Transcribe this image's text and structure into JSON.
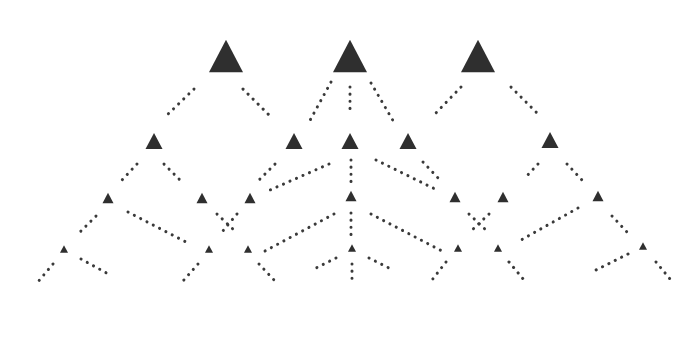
{
  "diagram": {
    "title": "",
    "colors": {
      "node": "#2f2f2f",
      "edge": "#3a3a3a",
      "background": "#ffffff"
    },
    "dot_spacing": 7,
    "nodes": [
      {
        "id": "A",
        "x": 226,
        "y": 56,
        "size": 34
      },
      {
        "id": "B",
        "x": 350,
        "y": 56,
        "size": 34
      },
      {
        "id": "C",
        "x": 478,
        "y": 56,
        "size": 34
      },
      {
        "id": "A1",
        "x": 154,
        "y": 141,
        "size": 17
      },
      {
        "id": "A2",
        "x": 294,
        "y": 141,
        "size": 17
      },
      {
        "id": "B1",
        "x": 350,
        "y": 141,
        "size": 17
      },
      {
        "id": "B2",
        "x": 408,
        "y": 141,
        "size": 17
      },
      {
        "id": "C1",
        "x": 550,
        "y": 140,
        "size": 17
      },
      {
        "id": "L3a",
        "x": 108,
        "y": 198,
        "size": 11
      },
      {
        "id": "L3b",
        "x": 202,
        "y": 198,
        "size": 11
      },
      {
        "id": "L3c",
        "x": 250,
        "y": 198,
        "size": 11
      },
      {
        "id": "L3d",
        "x": 351,
        "y": 196,
        "size": 11
      },
      {
        "id": "L3e",
        "x": 455,
        "y": 197,
        "size": 11
      },
      {
        "id": "L3f",
        "x": 503,
        "y": 197,
        "size": 11
      },
      {
        "id": "L3g",
        "x": 598,
        "y": 196,
        "size": 11
      },
      {
        "id": "L4a",
        "x": 64,
        "y": 249,
        "size": 8
      },
      {
        "id": "L4b",
        "x": 209,
        "y": 249,
        "size": 8
      },
      {
        "id": "L4c",
        "x": 248,
        "y": 249,
        "size": 8
      },
      {
        "id": "L4d",
        "x": 352,
        "y": 248,
        "size": 8
      },
      {
        "id": "L4e",
        "x": 458,
        "y": 248,
        "size": 8
      },
      {
        "id": "L4f",
        "x": 498,
        "y": 248,
        "size": 8
      },
      {
        "id": "L4g",
        "x": 643,
        "y": 246,
        "size": 8
      }
    ],
    "edges": [
      {
        "x1": 194,
        "y1": 89,
        "x2": 165,
        "y2": 117
      },
      {
        "x1": 243,
        "y1": 89,
        "x2": 271,
        "y2": 117
      },
      {
        "x1": 331,
        "y1": 82,
        "x2": 308,
        "y2": 124
      },
      {
        "x1": 350,
        "y1": 87,
        "x2": 350,
        "y2": 114
      },
      {
        "x1": 371,
        "y1": 83,
        "x2": 395,
        "y2": 124
      },
      {
        "x1": 461,
        "y1": 87,
        "x2": 433,
        "y2": 116
      },
      {
        "x1": 511,
        "y1": 87,
        "x2": 540,
        "y2": 116
      },
      {
        "x1": 137,
        "y1": 164,
        "x2": 122,
        "y2": 180
      },
      {
        "x1": 164,
        "y1": 164,
        "x2": 180,
        "y2": 180
      },
      {
        "x1": 275,
        "y1": 164,
        "x2": 259,
        "y2": 180
      },
      {
        "x1": 329,
        "y1": 164,
        "x2": 270,
        "y2": 190
      },
      {
        "x1": 351,
        "y1": 160,
        "x2": 351,
        "y2": 184
      },
      {
        "x1": 376,
        "y1": 160,
        "x2": 435,
        "y2": 189
      },
      {
        "x1": 423,
        "y1": 162,
        "x2": 440,
        "y2": 180
      },
      {
        "x1": 567,
        "y1": 164,
        "x2": 582,
        "y2": 180
      },
      {
        "x1": 538,
        "y1": 164,
        "x2": 524,
        "y2": 179
      },
      {
        "x1": 96,
        "y1": 216,
        "x2": 80,
        "y2": 232
      },
      {
        "x1": 128,
        "y1": 212,
        "x2": 186,
        "y2": 242
      },
      {
        "x1": 217,
        "y1": 214,
        "x2": 236,
        "y2": 232
      },
      {
        "x1": 237,
        "y1": 214,
        "x2": 222,
        "y2": 232
      },
      {
        "x1": 334,
        "y1": 214,
        "x2": 265,
        "y2": 251
      },
      {
        "x1": 351,
        "y1": 213,
        "x2": 351,
        "y2": 238
      },
      {
        "x1": 371,
        "y1": 214,
        "x2": 442,
        "y2": 251
      },
      {
        "x1": 469,
        "y1": 214,
        "x2": 488,
        "y2": 232
      },
      {
        "x1": 489,
        "y1": 214,
        "x2": 470,
        "y2": 232
      },
      {
        "x1": 578,
        "y1": 208,
        "x2": 521,
        "y2": 240
      },
      {
        "x1": 612,
        "y1": 216,
        "x2": 627,
        "y2": 232
      },
      {
        "x1": 53,
        "y1": 264,
        "x2": 37,
        "y2": 283
      },
      {
        "x1": 81,
        "y1": 259,
        "x2": 112,
        "y2": 276
      },
      {
        "x1": 198,
        "y1": 264,
        "x2": 183,
        "y2": 281
      },
      {
        "x1": 259,
        "y1": 264,
        "x2": 275,
        "y2": 281
      },
      {
        "x1": 336,
        "y1": 258,
        "x2": 312,
        "y2": 270
      },
      {
        "x1": 352,
        "y1": 264,
        "x2": 352,
        "y2": 281
      },
      {
        "x1": 369,
        "y1": 258,
        "x2": 393,
        "y2": 270
      },
      {
        "x1": 446,
        "y1": 262,
        "x2": 432,
        "y2": 280
      },
      {
        "x1": 509,
        "y1": 262,
        "x2": 524,
        "y2": 280
      },
      {
        "x1": 628,
        "y1": 254,
        "x2": 596,
        "y2": 270
      },
      {
        "x1": 656,
        "y1": 262,
        "x2": 670,
        "y2": 279
      }
    ]
  }
}
